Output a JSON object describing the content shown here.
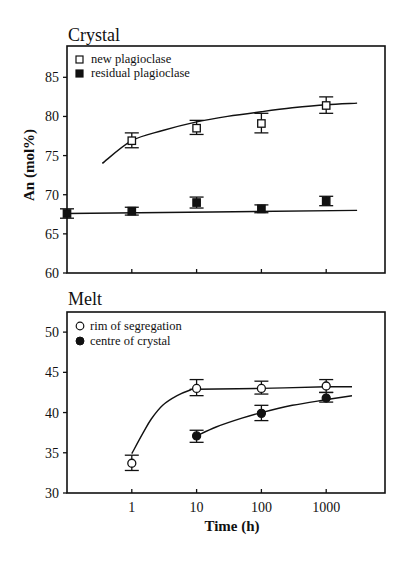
{
  "chart_data": [
    {
      "type": "scatter",
      "title": "Crystal",
      "xlabel": "",
      "ylabel": "An (mol%)",
      "xscale": "log",
      "xlim": [
        0.1,
        8000
      ],
      "ylim": [
        60,
        89
      ],
      "yticks": [
        60,
        65,
        70,
        75,
        80,
        85
      ],
      "xticks": [
        1,
        10,
        100,
        1000
      ],
      "xtick_labels_shown": false,
      "legend_position": "upper left",
      "series": [
        {
          "name": "new plagioclase",
          "marker": "open-square",
          "points": [
            {
              "x": 1,
              "y": 76.9,
              "err_low": 76.0,
              "err_high": 77.9
            },
            {
              "x": 10,
              "y": 78.5,
              "err_low": 77.7,
              "err_high": 79.5
            },
            {
              "x": 100,
              "y": 79.1,
              "err_low": 77.9,
              "err_high": 80.4
            },
            {
              "x": 1000,
              "y": 81.4,
              "err_low": 80.4,
              "err_high": 82.5
            }
          ],
          "fit_curve": [
            [
              0.35,
              74.0
            ],
            [
              1,
              76.9
            ],
            [
              3,
              78.2
            ],
            [
              10,
              79.3
            ],
            [
              30,
              80.0
            ],
            [
              100,
              80.6
            ],
            [
              300,
              81.1
            ],
            [
              1000,
              81.5
            ],
            [
              3000,
              81.7
            ]
          ]
        },
        {
          "name": "residual plagioclase",
          "marker": "filled-square",
          "points": [
            {
              "x": 0.1,
              "y": 67.6,
              "err_low": 67.0,
              "err_high": 68.2
            },
            {
              "x": 1,
              "y": 67.9,
              "err_low": 67.4,
              "err_high": 68.4
            },
            {
              "x": 10,
              "y": 69.0,
              "err_low": 68.3,
              "err_high": 69.7
            },
            {
              "x": 100,
              "y": 68.2,
              "err_low": 67.7,
              "err_high": 68.7
            },
            {
              "x": 1000,
              "y": 69.2,
              "err_low": 68.6,
              "err_high": 69.8
            }
          ],
          "fit_curve": [
            [
              0.1,
              67.6
            ],
            [
              3000,
              68.0
            ]
          ]
        }
      ]
    },
    {
      "type": "scatter",
      "title": "Melt",
      "xlabel": "Time (h)",
      "ylabel": "",
      "xscale": "log",
      "xlim": [
        0.1,
        8000
      ],
      "ylim": [
        30,
        52.5
      ],
      "yticks": [
        30,
        35,
        40,
        45,
        50
      ],
      "xticks": [
        1,
        10,
        100,
        1000
      ],
      "xtick_labels": [
        "1",
        "10",
        "100",
        "1000"
      ],
      "legend_position": "upper left",
      "series": [
        {
          "name": "rim of segregation",
          "marker": "open-circle",
          "points": [
            {
              "x": 1,
              "y": 33.7,
              "err_low": 32.8,
              "err_high": 34.7
            },
            {
              "x": 10,
              "y": 43.0,
              "err_low": 42.1,
              "err_high": 44.1
            },
            {
              "x": 100,
              "y": 43.0,
              "err_low": 42.3,
              "err_high": 43.9
            },
            {
              "x": 1000,
              "y": 43.3,
              "err_low": 42.5,
              "err_high": 44.1
            }
          ],
          "fit_curve": [
            [
              1,
              34.9
            ],
            [
              1.5,
              37.5
            ],
            [
              2,
              39.2
            ],
            [
              3,
              40.9
            ],
            [
              5,
              42.1
            ],
            [
              8,
              42.8
            ],
            [
              10,
              42.9
            ],
            [
              100,
              43.0
            ],
            [
              1000,
              43.2
            ],
            [
              2500,
              43.2
            ]
          ]
        },
        {
          "name": "centre of crystal",
          "marker": "filled-circle",
          "points": [
            {
              "x": 10,
              "y": 37.1,
              "err_low": 36.3,
              "err_high": 37.8
            },
            {
              "x": 100,
              "y": 39.9,
              "err_low": 39.0,
              "err_high": 40.9
            },
            {
              "x": 1000,
              "y": 41.8,
              "err_low": 41.3,
              "err_high": 42.5
            }
          ],
          "fit_curve": [
            [
              10,
              37.1
            ],
            [
              20,
              38.2
            ],
            [
              50,
              39.3
            ],
            [
              100,
              40.0
            ],
            [
              300,
              40.9
            ],
            [
              1000,
              41.6
            ],
            [
              2500,
              42.1
            ]
          ]
        }
      ]
    }
  ],
  "layout": {
    "panels": [
      {
        "left": 67,
        "right": 385,
        "top": 46,
        "bottom": 273
      },
      {
        "left": 67,
        "right": 385,
        "top": 312,
        "bottom": 493
      }
    ],
    "x_log_min": -1,
    "x_px_per_decade": 64.8,
    "colors": {
      "ink": "#111111",
      "background": "#ffffff"
    }
  }
}
